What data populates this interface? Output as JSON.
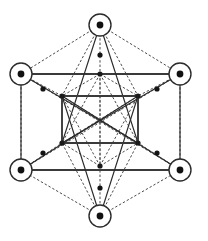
{
  "figure": {
    "background_color": "#ffffff",
    "line_color_solid": "#2b2b2b",
    "line_color_dashed": "#4a4a4a",
    "node_color": "#111111",
    "canvas": {
      "width": 208,
      "height": 241
    }
  },
  "chart_data": {
    "type": "diagram",
    "xlabel": "",
    "ylabel": "",
    "xlim": [
      0,
      208
    ],
    "ylim": [
      0,
      241
    ],
    "grid": false,
    "legend": "none",
    "outer_vertices": [
      {
        "name": "top",
        "x": 100,
        "y": 25,
        "ring_radius": 11,
        "dot_radius": 3.4
      },
      {
        "name": "upper-left",
        "x": 21,
        "y": 74,
        "ring_radius": 11,
        "dot_radius": 3.4
      },
      {
        "name": "upper-right",
        "x": 180,
        "y": 74,
        "ring_radius": 11,
        "dot_radius": 3.4
      },
      {
        "name": "lower-left",
        "x": 21,
        "y": 170,
        "ring_radius": 11,
        "dot_radius": 3.4
      },
      {
        "name": "lower-right",
        "x": 180,
        "y": 170,
        "ring_radius": 11,
        "dot_radius": 3.4
      },
      {
        "name": "bottom",
        "x": 100,
        "y": 216,
        "ring_radius": 11,
        "dot_radius": 3.4
      }
    ],
    "inner_vertices": [
      {
        "name": "inner-top",
        "x": 100,
        "y": 74,
        "dot_radius": 2.6
      },
      {
        "name": "inner-upper-left",
        "x": 62,
        "y": 96,
        "dot_radius": 2.6
      },
      {
        "name": "inner-upper-right",
        "x": 138,
        "y": 96,
        "dot_radius": 2.6
      },
      {
        "name": "inner-lower-left",
        "x": 62,
        "y": 143,
        "dot_radius": 2.6
      },
      {
        "name": "inner-lower-right",
        "x": 138,
        "y": 143,
        "dot_radius": 2.6
      },
      {
        "name": "inner-bottom",
        "x": 100,
        "y": 166,
        "dot_radius": 2.6
      }
    ],
    "mid_dots": [
      {
        "name": "mid-top",
        "x": 100,
        "y": 55,
        "dot_radius": 2.6
      },
      {
        "name": "mid-upper-left",
        "x": 43,
        "y": 89,
        "dot_radius": 2.6
      },
      {
        "name": "mid-upper-right",
        "x": 157,
        "y": 89,
        "dot_radius": 2.6
      },
      {
        "name": "mid-lower-left",
        "x": 43,
        "y": 153,
        "dot_radius": 2.6
      },
      {
        "name": "mid-lower-right",
        "x": 157,
        "y": 153,
        "dot_radius": 2.6
      },
      {
        "name": "mid-bottom",
        "x": 100,
        "y": 188,
        "dot_radius": 2.6
      }
    ],
    "solid_edges": [
      {
        "from": "upper-left",
        "to": "upper-right",
        "style": "heavy"
      },
      {
        "from": "lower-left",
        "to": "lower-right",
        "style": "heavy"
      },
      {
        "from": "top",
        "to": "inner-lower-left",
        "style": "normal"
      },
      {
        "from": "top",
        "to": "inner-lower-right",
        "style": "normal"
      },
      {
        "from": "bottom",
        "to": "inner-upper-left",
        "style": "normal"
      },
      {
        "from": "bottom",
        "to": "inner-upper-right",
        "style": "normal"
      },
      {
        "from": "upper-left",
        "to": "inner-lower-right",
        "style": "normal"
      },
      {
        "from": "upper-right",
        "to": "inner-lower-left",
        "style": "normal"
      },
      {
        "from": "lower-left",
        "to": "inner-upper-right",
        "style": "normal"
      },
      {
        "from": "lower-right",
        "to": "inner-upper-left",
        "style": "normal"
      },
      {
        "from": "upper-left",
        "to": "lower-left",
        "style": "normal"
      },
      {
        "from": "upper-right",
        "to": "lower-right",
        "style": "normal"
      },
      {
        "from": "inner-upper-left",
        "to": "inner-upper-right",
        "style": "heavy"
      },
      {
        "from": "inner-upper-right",
        "to": "inner-lower-right",
        "style": "heavy"
      },
      {
        "from": "inner-lower-right",
        "to": "inner-lower-left",
        "style": "heavy"
      },
      {
        "from": "inner-lower-left",
        "to": "inner-upper-left",
        "style": "heavy"
      }
    ],
    "dashed_edges": [
      {
        "from": "top",
        "to": "upper-left"
      },
      {
        "from": "top",
        "to": "upper-right"
      },
      {
        "from": "bottom",
        "to": "lower-left"
      },
      {
        "from": "bottom",
        "to": "lower-right"
      },
      {
        "from": "upper-left",
        "to": "lower-left"
      },
      {
        "from": "upper-right",
        "to": "lower-right"
      },
      {
        "from": "top",
        "to": "bottom"
      },
      {
        "from": "upper-left",
        "to": "lower-right"
      },
      {
        "from": "upper-right",
        "to": "lower-left"
      },
      {
        "from": "top",
        "to": "inner-upper-left"
      },
      {
        "from": "top",
        "to": "inner-upper-right"
      },
      {
        "from": "bottom",
        "to": "inner-lower-left"
      },
      {
        "from": "bottom",
        "to": "inner-lower-right"
      },
      {
        "from": "upper-left",
        "to": "inner-upper-left"
      },
      {
        "from": "upper-right",
        "to": "inner-upper-right"
      },
      {
        "from": "lower-left",
        "to": "inner-lower-left"
      },
      {
        "from": "lower-right",
        "to": "inner-lower-right"
      },
      {
        "from": "inner-top",
        "to": "inner-upper-left"
      },
      {
        "from": "inner-top",
        "to": "inner-upper-right"
      },
      {
        "from": "inner-top",
        "to": "inner-lower-left"
      },
      {
        "from": "inner-top",
        "to": "inner-lower-right"
      },
      {
        "from": "inner-top",
        "to": "inner-bottom"
      },
      {
        "from": "inner-bottom",
        "to": "inner-upper-left"
      },
      {
        "from": "inner-bottom",
        "to": "inner-upper-right"
      },
      {
        "from": "inner-bottom",
        "to": "inner-lower-left"
      },
      {
        "from": "inner-bottom",
        "to": "inner-lower-right"
      },
      {
        "from": "inner-upper-left",
        "to": "inner-lower-right"
      },
      {
        "from": "inner-upper-right",
        "to": "inner-lower-left"
      },
      {
        "from": "inner-upper-left",
        "to": "inner-upper-right"
      },
      {
        "from": "inner-lower-left",
        "to": "inner-lower-right"
      }
    ]
  }
}
